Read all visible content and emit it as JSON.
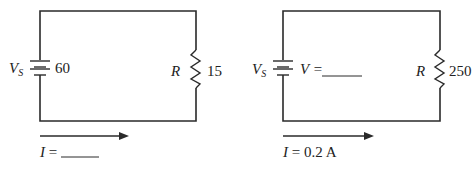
{
  "circuits": [
    {
      "source": {
        "symbol": "V",
        "subscript": "S",
        "value": "60"
      },
      "resistor": {
        "symbol": "R",
        "value": "15"
      },
      "current": {
        "symbol": "I",
        "equals": "=",
        "value": "______"
      }
    },
    {
      "source": {
        "symbol": "V",
        "subscript": "S",
        "voltage_label": "V =",
        "value": "______"
      },
      "resistor": {
        "symbol": "R",
        "value": "250"
      },
      "current": {
        "symbol": "I",
        "equals": "=",
        "value": "0.2 A"
      }
    }
  ],
  "colors": {
    "wire": "#2a2a2a",
    "text": "#222222",
    "background": "#ffffff"
  }
}
